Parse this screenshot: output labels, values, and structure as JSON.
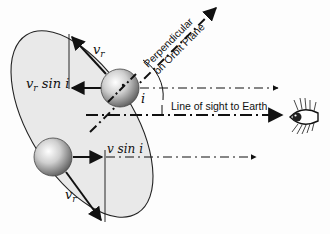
{
  "diagram": {
    "labels": {
      "vr_top": "v",
      "vr_top_sub": "r",
      "vr_sin_i_main": "v",
      "vr_sin_i_sub": "r",
      "vr_sin_i_tail": " sin i",
      "v_sin_i": "v sin i",
      "vr_bottom": "v",
      "vr_bottom_sub": "r",
      "angle_i": "i",
      "perpendicular_line1": "Perpendicular",
      "perpendicular_line2": "on Orbit Plane",
      "line_of_sight": "Line of sight to Earth"
    },
    "elements": {
      "orbit_ellipse": "tilted elliptical orbit plane (light grey fill)",
      "upper_star": "sphere on upper part of orbit",
      "lower_star": "sphere on lower part of orbit",
      "observer": "eye-icon"
    },
    "colors": {
      "ellipse_fill": "#e9e9e9",
      "stroke": "#111111",
      "sphere_light": "#f4f4f4",
      "sphere_dark": "#6a6a6a"
    }
  }
}
